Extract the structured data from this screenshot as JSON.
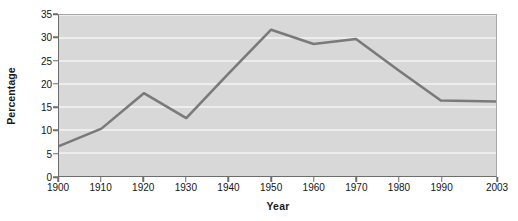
{
  "chart_data": {
    "type": "line",
    "title": "",
    "subtitle": "",
    "xlabel": "Year",
    "ylabel": "Percentage",
    "categories": [
      "1900",
      "1910",
      "1920",
      "1930",
      "1940",
      "1950",
      "1960",
      "1970",
      "1980",
      "1990",
      "2003"
    ],
    "x": [
      1900,
      1910,
      1920,
      1930,
      1940,
      1950,
      1960,
      1970,
      1980,
      1990,
      2003
    ],
    "values": [
      6.5,
      10.3,
      18.0,
      12.6,
      22.3,
      31.8,
      28.7,
      29.8,
      23.0,
      16.4,
      16.2
    ],
    "series": [
      {
        "name": "Percentage",
        "values": [
          6.5,
          10.3,
          18.0,
          12.6,
          22.3,
          31.8,
          28.7,
          29.8,
          23.0,
          16.4,
          16.2
        ]
      }
    ],
    "xlim": [
      1900,
      2003
    ],
    "ylim": [
      0,
      35
    ],
    "yticks": [
      0,
      5,
      10,
      15,
      20,
      25,
      30,
      35
    ],
    "ytick_labels": [
      "0",
      "5",
      "10",
      "15",
      "20",
      "25",
      "30",
      "35"
    ],
    "xticks": [
      1900,
      1910,
      1920,
      1930,
      1940,
      1950,
      1960,
      1970,
      1980,
      1990,
      2003
    ],
    "xtick_labels": [
      "1900",
      "1910",
      "1920",
      "1930",
      "1940",
      "1950",
      "1960",
      "1970",
      "1980",
      "1990",
      "2003"
    ],
    "grid": "horizontal",
    "legend": "none",
    "annotations": [],
    "colors": {
      "line": "#7a7a7a",
      "plot_background": "#d8d8d8",
      "gridline": "#f4f4f4",
      "axis": "#6d6d6d",
      "text": "#141414",
      "figure_background": "#ffffff"
    },
    "line_width": 2.6,
    "markers": "none"
  }
}
